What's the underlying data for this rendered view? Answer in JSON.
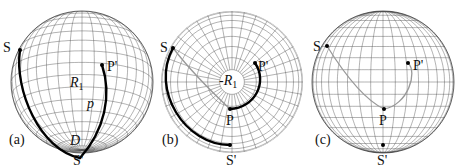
{
  "figure": {
    "panels": [
      {
        "id": "a",
        "caption": "(a)",
        "labels": {
          "S": "S",
          "S_prime": "S'",
          "P_prime": "P'",
          "region": "R",
          "region_sub": "1",
          "path": "p",
          "D": "D"
        }
      },
      {
        "id": "b",
        "caption": "(b)",
        "labels": {
          "S": "S",
          "S_prime": "S'",
          "P": "P",
          "P_prime": "P'",
          "region": "-R",
          "region_sub": "1"
        }
      },
      {
        "id": "c",
        "caption": "(c)",
        "labels": {
          "S": "S",
          "S_prime": "S'",
          "P": "P",
          "P_prime": "P'"
        }
      }
    ],
    "colors": {
      "thick_path": "#000000",
      "thin_path": "#999999",
      "grid": "#555555"
    }
  }
}
